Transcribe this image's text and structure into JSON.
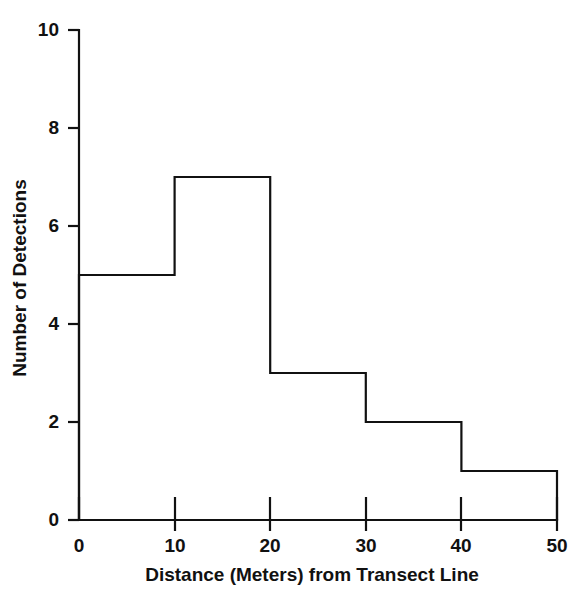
{
  "chart_data": {
    "type": "bar",
    "title": "",
    "subtitle": "",
    "xlabel": "Distance (Meters) from Transect Line",
    "ylabel": "Number of Detections",
    "categories": [
      "0-10",
      "10-20",
      "20-30",
      "30-40",
      "40-50"
    ],
    "bin_edges": [
      0,
      10,
      20,
      30,
      40,
      50
    ],
    "values": [
      5,
      7,
      3,
      2,
      1
    ],
    "xlim": [
      0,
      50
    ],
    "ylim": [
      0,
      10
    ],
    "xticks": [
      0,
      10,
      20,
      30,
      40,
      50
    ],
    "yticks": [
      0,
      2,
      4,
      6,
      8,
      10
    ],
    "xtick_labels": [
      "0",
      "10",
      "20",
      "30",
      "40",
      "50"
    ],
    "ytick_labels": [
      "0",
      "2",
      "4",
      "6",
      "8",
      "10"
    ],
    "grid": false,
    "legend": null,
    "annotations": [],
    "style": {
      "bar_fill": "none",
      "bar_stroke": "#111111",
      "axis_color": "#111111",
      "background": "#ffffff",
      "bar_style": "outline-histogram"
    }
  },
  "figure": {
    "background_color": "#ffffff",
    "width": 584,
    "height": 603
  }
}
